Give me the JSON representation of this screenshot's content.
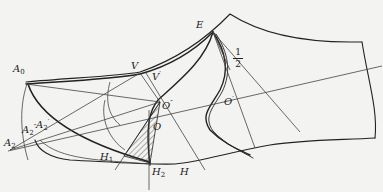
{
  "diagram": {
    "type": "shoe-last pattern construction drawing",
    "colors": {
      "background": "#f3f3f1",
      "stroke": "#222222",
      "thin_stroke": "#444444"
    },
    "points": {
      "A0": {
        "base": "A",
        "sub": "0",
        "sup": ""
      },
      "A2": {
        "base": "A",
        "sub": "2",
        "sup": ""
      },
      "A2pp": {
        "base": "A",
        "sub": "2",
        "sup": "″"
      },
      "A2p": {
        "base": "A",
        "sub": "2",
        "sup": "′"
      },
      "V": {
        "base": "V",
        "sub": "",
        "sup": ""
      },
      "Vp": {
        "base": "V",
        "sub": "",
        "sup": "′"
      },
      "E": {
        "base": "E",
        "sub": "",
        "sup": ""
      },
      "Opp": {
        "base": "O",
        "sub": "",
        "sup": "″"
      },
      "O": {
        "base": "O",
        "sub": "",
        "sup": ""
      },
      "Op": {
        "base": "O",
        "sub": "",
        "sup": "′"
      },
      "H1": {
        "base": "H",
        "sub": "1",
        "sup": ""
      },
      "H2": {
        "base": "H",
        "sub": "2",
        "sup": ""
      },
      "H": {
        "base": "H",
        "sub": "",
        "sup": ""
      }
    },
    "fraction": {
      "numerator": "1",
      "denominator": "2"
    },
    "hatched_region": "triangle O-H1-H2"
  }
}
